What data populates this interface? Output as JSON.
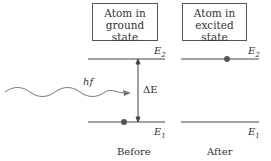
{
  "diagram": {
    "before_box": {
      "line1": "Atom in",
      "line2": "ground state"
    },
    "after_box": {
      "line1": "Atom in",
      "line2": "excited state"
    },
    "levels": {
      "upper": "E",
      "upper_sub": "2",
      "lower": "E",
      "lower_sub": "1"
    },
    "photon_label": "hf",
    "gap_label": "ΔE",
    "captions": {
      "before": "Before",
      "after": "After"
    },
    "colors": {
      "line": "#444444",
      "dot": "#555555",
      "wave": "#777777"
    }
  }
}
